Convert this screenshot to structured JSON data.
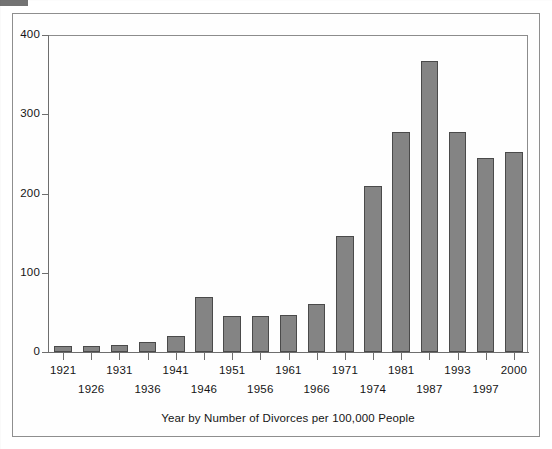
{
  "figure": {
    "caption": "Year by Number of Divorces per 100,000 People"
  },
  "chart_data": {
    "type": "bar",
    "title": "",
    "subtitle": "",
    "xlabel": "Year by Number of Divorces per 100,000 People",
    "ylabel": "",
    "categories": [
      "1921",
      "1926",
      "1931",
      "1936",
      "1941",
      "1946",
      "1951",
      "1956",
      "1961",
      "1966",
      "1971",
      "1974",
      "1981",
      "1987",
      "1993",
      "1997",
      "2000"
    ],
    "values": [
      8,
      8,
      9,
      13,
      20,
      70,
      46,
      46,
      47,
      60,
      146,
      210,
      278,
      367,
      278,
      245,
      253
    ],
    "ylim": [
      0,
      400
    ],
    "yticks": [
      0,
      100,
      200,
      300,
      400
    ],
    "ytick_labels": [
      "0",
      "100",
      "200",
      "300",
      "400"
    ],
    "grid": false,
    "legend": "none",
    "bar_color": "#848484",
    "bar_edge_color": "#4a4a4a",
    "axis_color": "#6e6e6e",
    "label_rows": [
      "top",
      "bottom",
      "top",
      "bottom",
      "top",
      "bottom",
      "top",
      "bottom",
      "top",
      "bottom",
      "top",
      "bottom",
      "top",
      "bottom",
      "top",
      "bottom",
      "top"
    ]
  }
}
